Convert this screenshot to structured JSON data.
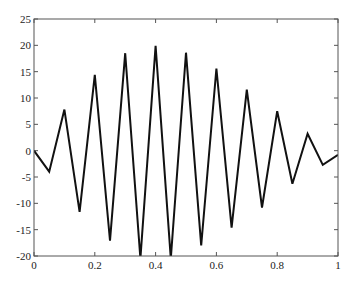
{
  "chart_data": {
    "type": "line",
    "title": "",
    "xlabel": "",
    "ylabel": "",
    "xlim": [
      0,
      1
    ],
    "ylim": [
      -20,
      25
    ],
    "grid": false,
    "legend": null,
    "x_ticks": [
      "0",
      "0.2",
      "0.4",
      "0.6",
      "0.8",
      "1"
    ],
    "y_ticks": [
      "25",
      "20",
      "15",
      "10",
      "5",
      "0",
      "-5",
      "-10",
      "-15",
      "-20"
    ],
    "series": [
      {
        "name": "signal",
        "color": "#111111",
        "x": [
          0,
          0.05,
          0.1,
          0.15,
          0.2,
          0.25,
          0.3,
          0.35,
          0.4,
          0.45,
          0.5,
          0.55,
          0.6,
          0.65,
          0.7,
          0.75,
          0.8,
          0.85,
          0.9,
          0.95,
          1.0
        ],
        "values": [
          0,
          -4,
          7.8,
          -11.6,
          14.4,
          -17.1,
          18.5,
          -20.5,
          19.9,
          -20.5,
          18.6,
          -18,
          15.6,
          -14.6,
          11.6,
          -10.8,
          7.5,
          -6.3,
          3.2,
          -2.7,
          -0.8
        ]
      }
    ]
  }
}
